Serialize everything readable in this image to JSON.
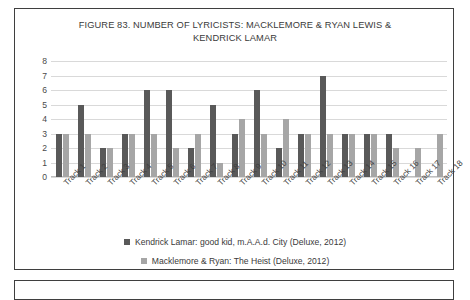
{
  "figure": {
    "title": "FIGURE 83. NUMBER OF LYRICISTS: MACKLEMORE & RYAN LEWIS & KENDRICK LAMAR"
  },
  "colors": {
    "kendrick": "#595959",
    "macklemore": "#a6a6a6",
    "gridline": "#d9d9d9",
    "border": "#3f3f3f"
  },
  "chart_data": {
    "type": "bar",
    "title": "FIGURE 83. NUMBER OF LYRICISTS: MACKLEMORE & RYAN LEWIS & KENDRICK LAMAR",
    "xlabel": "",
    "ylabel": "",
    "ylim": [
      0,
      8
    ],
    "yticks": [
      0,
      1,
      2,
      3,
      4,
      5,
      6,
      7,
      8
    ],
    "grid": true,
    "legend_position": "bottom",
    "categories": [
      "Track 1",
      "Track 2",
      "Track 3",
      "Track 4",
      "Track 5",
      "Track 6",
      "Track 7",
      "Track 8",
      "Track 9",
      "Track 10",
      "Track 11",
      "Track 12",
      "Track 13",
      "Track 14",
      "Track 15",
      "Track 16",
      "Track 17",
      "Track 18"
    ],
    "series": [
      {
        "name": "Kendrick Lamar: good kid, m.A.A.d. City (Deluxe, 2012)",
        "color": "#595959",
        "values": [
          3,
          5,
          2,
          3,
          6,
          6,
          2,
          5,
          3,
          6,
          2,
          3,
          7,
          3,
          3,
          3,
          0,
          0
        ]
      },
      {
        "name": "Macklemore & Ryan: The Heist (Deluxe, 2012)",
        "color": "#a6a6a6",
        "values": [
          3,
          3,
          2,
          3,
          3,
          2,
          3,
          1,
          4,
          3,
          4,
          3,
          3,
          3,
          3,
          2,
          2,
          3
        ]
      }
    ]
  },
  "legend": {
    "items": [
      {
        "label": "Kendrick Lamar: good kid, m.A.A.d. City (Deluxe, 2012)",
        "swatch": "kl"
      },
      {
        "label": "Macklemore & Ryan: The Heist (Deluxe, 2012)",
        "swatch": "mr"
      }
    ]
  }
}
